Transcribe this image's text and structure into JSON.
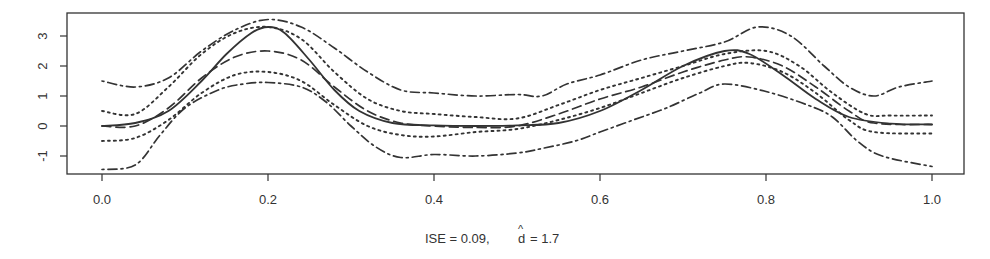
{
  "chart_data": {
    "type": "line",
    "title": "",
    "xlabel": "ISE =  0.09,  d̂ = 1.7",
    "caption": {
      "ise_label": "ISE =  0.09,",
      "d_label": "d",
      "d_hat": "^",
      "d_value": "= 1.7"
    },
    "ylabel": "",
    "xlim": [
      0.0,
      1.0
    ],
    "ylim": [
      -1.5,
      3.7
    ],
    "x_ticks": [
      "0.0",
      "0.2",
      "0.4",
      "0.6",
      "0.8",
      "1.0"
    ],
    "y_ticks": [
      "-1",
      "0",
      "1",
      "2",
      "3"
    ],
    "grid": false,
    "legend": null,
    "series": [
      {
        "name": "true function",
        "style": "solid",
        "color": "#333333",
        "x": [
          0.0,
          0.04,
          0.08,
          0.12,
          0.15,
          0.18,
          0.2,
          0.22,
          0.25,
          0.28,
          0.31,
          0.35,
          0.4,
          0.45,
          0.5,
          0.55,
          0.6,
          0.65,
          0.7,
          0.75,
          0.78,
          0.82,
          0.86,
          0.9,
          0.95,
          1.0
        ],
        "y": [
          0.0,
          0.1,
          0.5,
          1.5,
          2.4,
          3.1,
          3.3,
          3.1,
          2.2,
          1.2,
          0.5,
          0.1,
          0.02,
          0.0,
          0.02,
          0.1,
          0.5,
          1.2,
          2.0,
          2.5,
          2.4,
          1.7,
          0.9,
          0.3,
          0.08,
          0.05
        ]
      },
      {
        "name": "estimate",
        "style": "dashed",
        "color": "#333333",
        "x": [
          0.0,
          0.04,
          0.08,
          0.12,
          0.16,
          0.2,
          0.24,
          0.28,
          0.32,
          0.36,
          0.4,
          0.45,
          0.5,
          0.55,
          0.6,
          0.65,
          0.7,
          0.75,
          0.78,
          0.82,
          0.86,
          0.9,
          0.93,
          1.0
        ],
        "y": [
          0.0,
          0.0,
          0.6,
          1.6,
          2.3,
          2.5,
          2.2,
          1.3,
          0.5,
          0.1,
          0.0,
          -0.05,
          0.0,
          0.4,
          0.9,
          1.3,
          1.8,
          2.2,
          2.3,
          2.0,
          1.3,
          0.5,
          0.1,
          0.05
        ]
      },
      {
        "name": "upper pointwise band",
        "style": "dotted",
        "color": "#333333",
        "x": [
          0.0,
          0.04,
          0.08,
          0.12,
          0.16,
          0.2,
          0.24,
          0.28,
          0.32,
          0.36,
          0.4,
          0.45,
          0.5,
          0.55,
          0.6,
          0.65,
          0.7,
          0.75,
          0.8,
          0.84,
          0.88,
          0.92,
          0.95,
          1.0
        ],
        "y": [
          0.5,
          0.4,
          1.3,
          2.4,
          3.1,
          3.3,
          2.9,
          1.8,
          0.9,
          0.5,
          0.4,
          0.3,
          0.25,
          0.7,
          1.2,
          1.6,
          2.0,
          2.4,
          2.5,
          2.0,
          1.1,
          0.4,
          0.35,
          0.35
        ]
      },
      {
        "name": "lower pointwise band",
        "style": "dotted",
        "color": "#333333",
        "x": [
          0.0,
          0.04,
          0.08,
          0.12,
          0.16,
          0.2,
          0.24,
          0.28,
          0.32,
          0.36,
          0.4,
          0.45,
          0.5,
          0.55,
          0.6,
          0.65,
          0.7,
          0.75,
          0.78,
          0.82,
          0.86,
          0.9,
          0.93,
          1.0
        ],
        "y": [
          -0.5,
          -0.4,
          0.2,
          1.1,
          1.7,
          1.8,
          1.5,
          0.7,
          0.0,
          -0.3,
          -0.35,
          -0.2,
          -0.1,
          0.2,
          0.6,
          1.1,
          1.6,
          2.0,
          2.1,
          1.8,
          1.1,
          0.2,
          -0.2,
          -0.25
        ]
      },
      {
        "name": "upper simultaneous band",
        "style": "dashdot",
        "color": "#333333",
        "x": [
          0.0,
          0.04,
          0.08,
          0.12,
          0.16,
          0.2,
          0.24,
          0.28,
          0.32,
          0.36,
          0.4,
          0.45,
          0.5,
          0.53,
          0.56,
          0.6,
          0.65,
          0.7,
          0.75,
          0.79,
          0.83,
          0.87,
          0.9,
          0.93,
          0.96,
          1.0
        ],
        "y": [
          1.5,
          1.3,
          1.6,
          2.5,
          3.2,
          3.55,
          3.3,
          2.6,
          1.8,
          1.2,
          1.1,
          1.0,
          1.05,
          1.0,
          1.4,
          1.7,
          2.2,
          2.5,
          2.8,
          3.3,
          3.0,
          2.0,
          1.3,
          1.0,
          1.3,
          1.5
        ]
      },
      {
        "name": "lower simultaneous band",
        "style": "dashdot",
        "color": "#333333",
        "x": [
          0.0,
          0.04,
          0.07,
          0.1,
          0.14,
          0.17,
          0.2,
          0.24,
          0.27,
          0.3,
          0.33,
          0.36,
          0.4,
          0.45,
          0.5,
          0.53,
          0.57,
          0.6,
          0.64,
          0.68,
          0.72,
          0.75,
          0.8,
          0.85,
          0.88,
          0.91,
          0.94,
          1.0
        ],
        "y": [
          -1.45,
          -1.3,
          -0.3,
          0.6,
          1.2,
          1.4,
          1.45,
          1.3,
          0.8,
          0.0,
          -0.7,
          -1.05,
          -0.95,
          -1.0,
          -0.9,
          -0.75,
          -0.5,
          -0.2,
          0.2,
          0.6,
          1.1,
          1.4,
          1.15,
          0.7,
          0.3,
          -0.5,
          -1.0,
          -1.35
        ]
      }
    ]
  },
  "plot_area": {
    "left_px": 67,
    "right_px": 964,
    "top_px": 13,
    "bottom_px": 174,
    "x0_px": 102,
    "x1_px": 932,
    "y0_px": 126,
    "px_per_y_unit": 30
  },
  "colors": {
    "axis": "#333333",
    "line": "#333333",
    "background": "#ffffff"
  }
}
